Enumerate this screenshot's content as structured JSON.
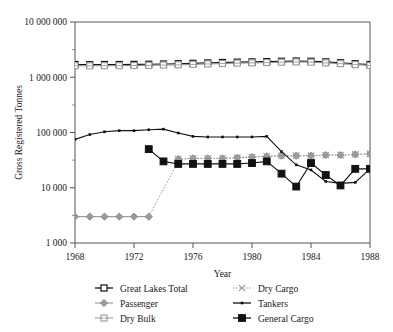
{
  "chart_data": {
    "type": "line",
    "title": "",
    "xlabel": "Year",
    "ylabel": "Gross Registered Tonnes",
    "yscale": "log",
    "ylim": [
      1000,
      10000000
    ],
    "xlim": [
      1968,
      1988
    ],
    "grid": false,
    "legend_position": "bottom",
    "ytick_labels": [
      "1 000",
      "10 000",
      "100 000",
      "1 000 000",
      "10 000 000"
    ],
    "ytick_values": [
      1000,
      10000,
      100000,
      1000000,
      10000000
    ],
    "xtick_labels": [
      "1968",
      "1972",
      "1976",
      "1980",
      "1984",
      "1988"
    ],
    "xtick_values": [
      1968,
      1972,
      1976,
      1980,
      1984,
      1988
    ],
    "x": [
      1968,
      1969,
      1970,
      1971,
      1972,
      1973,
      1974,
      1975,
      1976,
      1977,
      1978,
      1979,
      1980,
      1981,
      1982,
      1983,
      1984,
      1985,
      1986,
      1987,
      1988
    ],
    "series": [
      {
        "name": "Great Lakes Total",
        "marker": "open-square-dark",
        "color": "#111111",
        "values": [
          1700000,
          1690000,
          1700000,
          1700000,
          1710000,
          1720000,
          1740000,
          1760000,
          1790000,
          1820000,
          1850000,
          1880000,
          1900000,
          1920000,
          1950000,
          1970000,
          1950000,
          1900000,
          1830000,
          1760000,
          1700000
        ]
      },
      {
        "name": "Passenger",
        "marker": "filled-diamond-gray",
        "color": "#8d8d8d",
        "values": [
          3000,
          3000,
          3000,
          3000,
          3000,
          3000,
          null,
          null,
          null,
          null,
          null,
          null,
          null,
          null,
          null,
          null,
          null,
          null,
          null,
          null,
          null
        ]
      },
      {
        "name": "Dry Bulk",
        "marker": "open-square-gray",
        "color": "#8d8d8d",
        "values": [
          1620000,
          1610000,
          1620000,
          1620000,
          1630000,
          1640000,
          1660000,
          1680000,
          1710000,
          1740000,
          1770000,
          1800000,
          1820000,
          1840000,
          1870000,
          1890000,
          1870000,
          1820000,
          1760000,
          1690000,
          1630000
        ]
      },
      {
        "name": "Dry Cargo",
        "marker": "x-gray",
        "color": "#9a9a9a",
        "values": [
          null,
          null,
          null,
          null,
          null,
          null,
          null,
          33000,
          34000,
          34000,
          34000,
          35000,
          36000,
          37000,
          38000,
          38000,
          38000,
          39000,
          39000,
          40000,
          41000
        ]
      },
      {
        "name": "Tankers",
        "marker": "small-dot-dark",
        "color": "#111111",
        "values": [
          75000,
          92000,
          103000,
          108000,
          108000,
          112000,
          115000,
          98000,
          85000,
          83000,
          83000,
          83000,
          83000,
          85000,
          45000,
          26000,
          21000,
          13000,
          12000,
          12500,
          22000
        ]
      },
      {
        "name": "General Cargo",
        "marker": "filled-square-dark",
        "color": "#111111",
        "values": [
          null,
          null,
          null,
          null,
          null,
          50000,
          30000,
          27000,
          27000,
          27000,
          27000,
          27000,
          28000,
          30000,
          18000,
          10500,
          28000,
          17000,
          11000,
          22000,
          22000
        ]
      }
    ],
    "passenger_jump": {
      "from_year": 1973,
      "to_year": 1975,
      "to_value": 30000,
      "style": "dotted"
    },
    "legend_entries": [
      {
        "label": "Great Lakes Total",
        "marker": "open-square-dark",
        "column": 0
      },
      {
        "label": "Passenger",
        "marker": "filled-diamond-gray",
        "column": 0
      },
      {
        "label": "Dry Bulk",
        "marker": "open-square-gray",
        "column": 0
      },
      {
        "label": "Dry Cargo",
        "marker": "x-gray",
        "column": 1
      },
      {
        "label": "Tankers",
        "marker": "small-dot-dark",
        "column": 1
      },
      {
        "label": "General Cargo",
        "marker": "filled-square-dark",
        "column": 1
      }
    ]
  }
}
